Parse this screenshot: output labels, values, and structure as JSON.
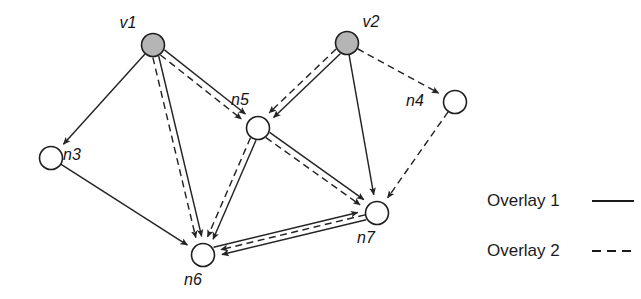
{
  "figure": {
    "type": "directed-graph-overlay-diagram",
    "background_color": "#ffffff",
    "edge_color": "#242424",
    "node_stroke_color": "#1e1e1e",
    "filled_node_color": "#b5b5b5",
    "open_node_color": "#ffffff"
  },
  "nodes": [
    {
      "id": "v1",
      "label": "v1",
      "cx": 153,
      "cy": 45,
      "r": 11.5,
      "style": "filled",
      "label_x": 128,
      "label_y": 28
    },
    {
      "id": "v2",
      "label": "v2",
      "cx": 347,
      "cy": 43,
      "r": 11.5,
      "style": "filled",
      "label_x": 371,
      "label_y": 27
    },
    {
      "id": "n3",
      "label": "n3",
      "cx": 51,
      "cy": 158,
      "r": 11.5,
      "style": "open",
      "label_x": 72,
      "label_y": 160
    },
    {
      "id": "n4",
      "label": "n4",
      "cx": 455,
      "cy": 102,
      "r": 11.5,
      "style": "open",
      "label_x": 415,
      "label_y": 106
    },
    {
      "id": "n5",
      "label": "n5",
      "cx": 258,
      "cy": 128,
      "r": 11.5,
      "style": "open",
      "label_x": 240,
      "label_y": 105
    },
    {
      "id": "n6",
      "label": "n6",
      "cx": 203,
      "cy": 255,
      "r": 11.5,
      "style": "open",
      "label_x": 193,
      "label_y": 285
    },
    {
      "id": "n7",
      "label": "n7",
      "cx": 377,
      "cy": 213,
      "r": 11.5,
      "style": "open",
      "label_x": 366,
      "label_y": 243
    }
  ],
  "edges": [
    {
      "from": "v1",
      "to": "n3",
      "overlay": "Overlay 1",
      "line": "solid",
      "offset": 0
    },
    {
      "from": "v1",
      "to": "n5",
      "overlay": "Overlay 1",
      "line": "solid",
      "offset": -3.2
    },
    {
      "from": "v1",
      "to": "n5",
      "overlay": "Overlay 2",
      "line": "dashed",
      "offset": 3.2
    },
    {
      "from": "v1",
      "to": "n6",
      "overlay": "Overlay 1",
      "line": "solid",
      "offset": -3.0
    },
    {
      "from": "v1",
      "to": "n6",
      "overlay": "Overlay 2",
      "line": "dashed",
      "offset": 3.0
    },
    {
      "from": "v2",
      "to": "n5",
      "overlay": "Overlay 1",
      "line": "solid",
      "offset": -3.2
    },
    {
      "from": "v2",
      "to": "n5",
      "overlay": "Overlay 2",
      "line": "dashed",
      "offset": 3.2
    },
    {
      "from": "v2",
      "to": "n4",
      "overlay": "Overlay 2",
      "line": "dashed",
      "offset": 0
    },
    {
      "from": "v2",
      "to": "n7",
      "overlay": "Overlay 1",
      "line": "solid",
      "offset": 0
    },
    {
      "from": "n4",
      "to": "n7",
      "overlay": "Overlay 2",
      "line": "dashed",
      "offset": 0
    },
    {
      "from": "n3",
      "to": "n6",
      "overlay": "Overlay 1",
      "line": "solid",
      "offset": 0
    },
    {
      "from": "n5",
      "to": "n6",
      "overlay": "Overlay 1",
      "line": "solid",
      "offset": -3.0
    },
    {
      "from": "n5",
      "to": "n6",
      "overlay": "Overlay 2",
      "line": "dashed",
      "offset": 3.0
    },
    {
      "from": "n5",
      "to": "n7",
      "overlay": "Overlay 1",
      "line": "solid",
      "offset": -3.2
    },
    {
      "from": "n5",
      "to": "n7",
      "overlay": "Overlay 2",
      "line": "dashed",
      "offset": 3.2
    },
    {
      "from": "n6",
      "to": "n7",
      "overlay": "Overlay 1",
      "line": "solid",
      "offset": -5.0
    },
    {
      "from": "n7",
      "to": "n6",
      "overlay": "Overlay 1",
      "line": "solid",
      "offset": -4.0
    },
    {
      "from": "n7",
      "to": "n6",
      "overlay": "Overlay 2",
      "line": "dashed",
      "offset": 1.0
    }
  ],
  "legend": {
    "items": [
      {
        "label": "Overlay 1",
        "line": "solid",
        "text_x": 487,
        "text_y": 206,
        "line_x1": 592,
        "line_x2": 634,
        "line_y": 201
      },
      {
        "label": "Overlay 2",
        "line": "dashed",
        "text_x": 487,
        "text_y": 256,
        "line_x1": 592,
        "line_x2": 634,
        "line_y": 251
      }
    ]
  }
}
